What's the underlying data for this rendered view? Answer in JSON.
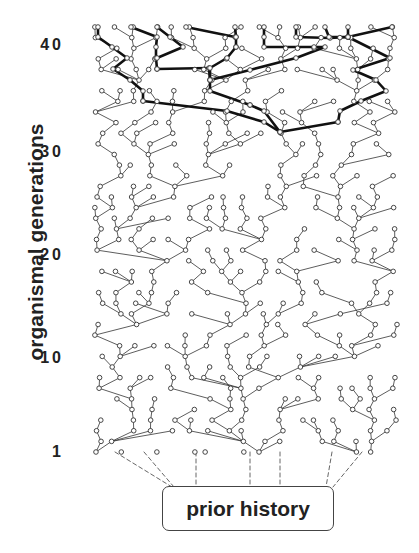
{
  "figure": {
    "y_axis_label": "organismal generations",
    "ticks": [
      {
        "label": "40",
        "y": 45
      },
      {
        "label": "30",
        "y": 152
      },
      {
        "label": "20",
        "y": 255
      },
      {
        "label": "10",
        "y": 358
      },
      {
        "label": "1",
        "y": 452
      }
    ],
    "root_box_label": "prior history",
    "caption_fragment": "",
    "generations": 41,
    "grid": {
      "x_min": 98,
      "x_max": 392,
      "y_top": 27,
      "y_bottom": 452,
      "columns": 17,
      "seed": 7
    },
    "colors": {
      "line": "#333333",
      "thick_line": "#111111",
      "node_fill": "#ffffff",
      "text": "#222222"
    },
    "dashed_connectors": [
      {
        "from": [
          115,
          452
        ],
        "to": [
          172,
          487
        ]
      },
      {
        "from": [
          144,
          452
        ],
        "to": [
          174,
          487
        ]
      },
      {
        "from": [
          196,
          452
        ],
        "to": [
          196,
          487
        ]
      },
      {
        "from": [
          250,
          452
        ],
        "to": [
          250,
          487
        ]
      },
      {
        "from": [
          280,
          452
        ],
        "to": [
          280,
          487
        ]
      },
      {
        "from": [
          332,
          452
        ],
        "to": [
          326,
          487
        ]
      },
      {
        "from": [
          362,
          452
        ],
        "to": [
          333,
          487
        ]
      }
    ],
    "highlighted_lineage": [
      [
        [
          98,
          27
        ],
        [
          98,
          37
        ],
        [
          112,
          47
        ],
        [
          127,
          58
        ],
        [
          113,
          69
        ],
        [
          130,
          80
        ],
        [
          143,
          91
        ],
        [
          143,
          101
        ]
      ],
      [
        [
          131,
          27
        ],
        [
          157,
          37
        ],
        [
          156,
          47
        ],
        [
          156,
          58
        ],
        [
          157,
          69
        ]
      ],
      [
        [
          157,
          27
        ],
        [
          170,
          37
        ],
        [
          183,
          47
        ],
        [
          157,
          58
        ]
      ],
      [
        [
          186,
          27
        ],
        [
          235,
          37
        ],
        [
          236,
          37
        ],
        [
          236,
          47
        ]
      ],
      [
        [
          235,
          27
        ],
        [
          236,
          37
        ]
      ],
      [
        [
          157,
          69
        ],
        [
          209,
          68
        ],
        [
          210,
          80
        ],
        [
          210,
          91
        ],
        [
          250,
          105
        ]
      ],
      [
        [
          236,
          47
        ],
        [
          227,
          58
        ],
        [
          210,
          68
        ],
        [
          210,
          80
        ]
      ],
      [
        [
          264,
          27
        ],
        [
          264,
          37
        ],
        [
          264,
          47
        ],
        [
          314,
          47
        ],
        [
          325,
          47
        ],
        [
          296,
          58
        ],
        [
          250,
          70
        ],
        [
          210,
          80
        ]
      ],
      [
        [
          296,
          27
        ],
        [
          296,
          37
        ],
        [
          330,
          38
        ],
        [
          348,
          37
        ]
      ],
      [
        [
          325,
          27
        ],
        [
          329,
          37
        ],
        [
          348,
          37
        ]
      ],
      [
        [
          348,
          27
        ],
        [
          348,
          37
        ],
        [
          392,
          27
        ]
      ],
      [
        [
          348,
          37
        ],
        [
          390,
          58
        ],
        [
          353,
          70
        ],
        [
          376,
          80
        ],
        [
          386,
          91
        ],
        [
          361,
          101
        ],
        [
          340,
          111
        ],
        [
          338,
          122
        ]
      ],
      [
        [
          143,
          101
        ],
        [
          227,
          111
        ],
        [
          264,
          122
        ],
        [
          280,
          132
        ]
      ],
      [
        [
          250,
          105
        ],
        [
          264,
          111
        ],
        [
          280,
          132
        ]
      ],
      [
        [
          338,
          122
        ],
        [
          280,
          132
        ]
      ]
    ]
  }
}
